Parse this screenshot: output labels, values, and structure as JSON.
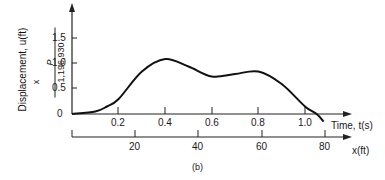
{
  "chart_data": {
    "type": "line",
    "title": "",
    "caption": "(b)",
    "ylabel": "Displacement, u(ft)",
    "ylabel_multiplier": "x P / 1,196,930",
    "ylabel_multiplier_numerator": "P",
    "ylabel_multiplier_denominator": "1,196,930",
    "ylabel_multiplier_prefix": "x",
    "xlabel": "Time, t(s)",
    "x2label": "x(ft)",
    "yticks": [
      "0",
      "0.5",
      "1.0",
      "1.5"
    ],
    "xticks": [
      "0.2",
      "0.4",
      "0.6",
      "0.8",
      "1.0"
    ],
    "x2ticks": [
      "20",
      "40",
      "60",
      "80"
    ],
    "ylim": [
      0,
      1.8
    ],
    "xlim": [
      0,
      1.2
    ],
    "grid": false,
    "series": [
      {
        "name": "displacement",
        "x": [
          0,
          0.1,
          0.15,
          0.2,
          0.3,
          0.4,
          0.5,
          0.6,
          0.7,
          0.8,
          0.9,
          1.0,
          1.05,
          1.08
        ],
        "y": [
          0,
          0.05,
          0.15,
          0.3,
          0.85,
          1.1,
          0.95,
          0.75,
          0.8,
          0.85,
          0.6,
          0.15,
          0,
          -0.15
        ]
      }
    ]
  }
}
